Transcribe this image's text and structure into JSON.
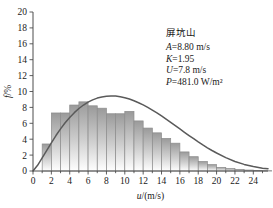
{
  "chart_data": {
    "type": "bar",
    "title": "",
    "xlabel": "u/(m/s)",
    "ylabel": "f/%",
    "xlim": [
      0,
      25.6
    ],
    "ylim": [
      0,
      20
    ],
    "xticks": [
      0,
      2,
      4,
      6,
      8,
      10,
      12,
      14,
      16,
      18,
      20,
      22,
      24
    ],
    "yticks": [
      0,
      2,
      4,
      6,
      8,
      10,
      12,
      14,
      16,
      18,
      20
    ],
    "grid": false,
    "legend": "none",
    "bar_width": 1,
    "bin_starts": [
      1,
      2,
      3,
      4,
      5,
      6,
      7,
      8,
      9,
      10,
      11,
      12,
      13,
      14,
      15,
      16,
      17,
      18,
      19,
      20,
      21,
      22,
      23,
      24,
      25
    ],
    "categories": [
      "1-2",
      "2-3",
      "3-4",
      "4-5",
      "5-6",
      "6-7",
      "7-8",
      "8-9",
      "9-10",
      "10-11",
      "11-12",
      "12-13",
      "13-14",
      "14-15",
      "15-16",
      "16-17",
      "17-18",
      "18-19",
      "19-20",
      "20-21",
      "21-22",
      "22-23",
      "23-24",
      "24-25",
      "25-26"
    ],
    "values": [
      3.4,
      7.3,
      7.3,
      8.3,
      8.7,
      8.2,
      7.9,
      7.2,
      7.2,
      7.5,
      6.3,
      5.4,
      4.8,
      4.1,
      3.5,
      2.4,
      1.8,
      1.2,
      0.8,
      0.45,
      0.3,
      0.2,
      0.12,
      0.08,
      0.04
    ],
    "series": [
      {
        "name": "Weibull fit",
        "type": "line",
        "x": [
          0,
          0.5,
          1,
          1.5,
          2,
          2.5,
          3,
          3.5,
          4,
          4.5,
          5,
          5.5,
          6,
          6.5,
          7,
          7.5,
          8,
          8.5,
          9,
          9.5,
          10,
          10.5,
          11,
          11.5,
          12,
          12.5,
          13,
          13.5,
          14,
          14.5,
          15,
          15.5,
          16,
          16.5,
          17,
          17.5,
          18,
          18.5,
          19,
          19.5,
          20,
          21,
          22,
          23,
          24,
          25,
          25.6
        ],
        "y": [
          0,
          0.72,
          1.64,
          2.6,
          3.55,
          4.46,
          5.3,
          6.06,
          6.74,
          7.34,
          7.86,
          8.3,
          8.66,
          8.95,
          9.17,
          9.32,
          9.41,
          9.44,
          9.42,
          9.34,
          9.22,
          9.05,
          8.84,
          8.59,
          8.31,
          8.0,
          7.66,
          7.3,
          6.92,
          6.52,
          6.12,
          5.7,
          5.29,
          4.87,
          4.46,
          4.06,
          3.66,
          3.28,
          2.92,
          2.58,
          2.26,
          1.68,
          1.2,
          0.83,
          0.56,
          0.36,
          0.28
        ]
      }
    ],
    "annotation": {
      "site": "屏坑山",
      "lines": [
        {
          "symbol": "A",
          "rest": "=8.80 m/s"
        },
        {
          "symbol": "K",
          "rest": "=1.95"
        },
        {
          "symbol": "U",
          "rest": "=7.8 m/s"
        },
        {
          "symbol": "P",
          "rest": "=481.0 W/m²"
        }
      ]
    },
    "colors": {
      "bar_top": "#9a9a9a",
      "bar_bottom": "#ffffff",
      "bar_edge": "#8c8c8c",
      "curve": "#5a5a5a",
      "axis": "#4d4d4d",
      "text": "#1a1a1a"
    }
  }
}
